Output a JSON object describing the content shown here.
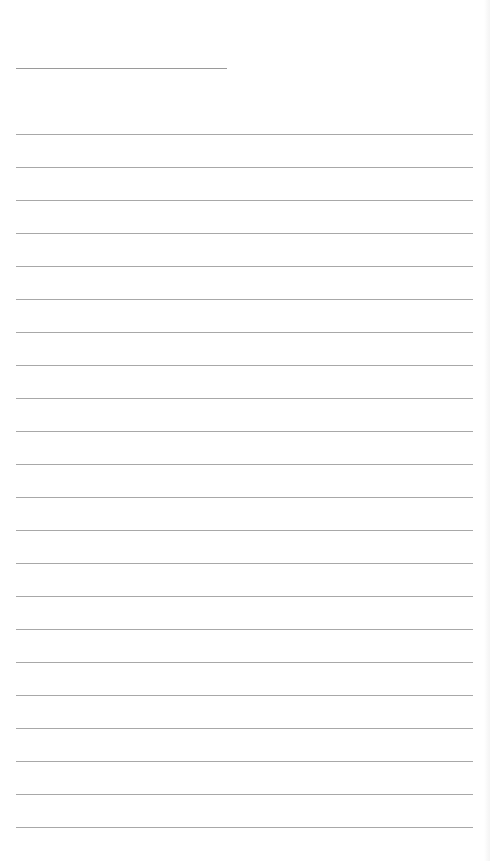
{
  "page": {
    "type": "ruled-notepaper",
    "background_color": "#ffffff",
    "line_color": "#a8a8a8",
    "title_line": {
      "x": 16,
      "y": 68,
      "width": 211
    },
    "ruled_lines": {
      "x": 16,
      "width": 457,
      "start_y": 134,
      "spacing": 33,
      "count": 22
    }
  }
}
